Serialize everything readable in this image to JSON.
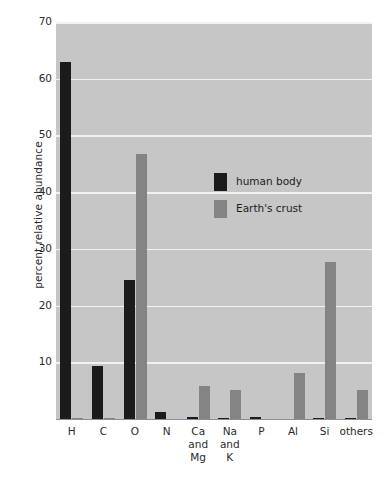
{
  "chart_data": {
    "type": "bar",
    "title": "",
    "xlabel": "",
    "ylabel": "percent relative abundance",
    "ylim": [
      0,
      70
    ],
    "yticks": [
      70,
      60,
      50,
      40,
      30,
      20,
      10
    ],
    "grid": true,
    "legend_position": "inside-upper-center",
    "categories": [
      "H",
      "C",
      "O",
      "N",
      "Ca and Mg",
      "Na and K",
      "P",
      "Al",
      "Si",
      "others"
    ],
    "category_lines": [
      [
        "H"
      ],
      [
        "C"
      ],
      [
        "O"
      ],
      [
        "N"
      ],
      [
        "Ca",
        "and",
        "Mg"
      ],
      [
        "Na",
        "and",
        "K"
      ],
      [
        "P"
      ],
      [
        "Al"
      ],
      [
        "Si"
      ],
      [
        "others"
      ]
    ],
    "series": [
      {
        "name": "human body",
        "color": "#1b1b1b",
        "values": [
          63.0,
          9.3,
          24.5,
          1.3,
          0.3,
          0.2,
          0.3,
          0.0,
          0.2,
          0.2
        ]
      },
      {
        "name": "Earth's crust",
        "color": "#848484",
        "values": [
          0.2,
          0.2,
          46.7,
          0.0,
          5.8,
          5.2,
          0.0,
          8.2,
          27.7,
          5.2
        ]
      }
    ]
  },
  "colors": {
    "plot_background": "#c6c6c6",
    "gridline": "#f2f2f2",
    "axis": "#8f8f8f",
    "text": "#2b2b2b",
    "page_background": "#ffffff"
  }
}
